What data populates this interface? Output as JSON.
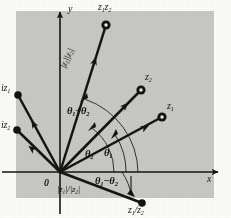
{
  "figure": {
    "background_color": "#c9c9c6",
    "page_color": "#fdfdfb",
    "ink_color": "#141414",
    "panel": {
      "x": 16,
      "y": 11,
      "width": 198,
      "height": 187
    }
  },
  "axes": {
    "x_label": "x",
    "y_label": "y",
    "origin_label": "0",
    "origin": {
      "x": 60,
      "y": 172
    },
    "x_axis": {
      "x1": 2,
      "y1": 172,
      "x2": 224,
      "y2": 172
    },
    "y_axis": {
      "x1": 60,
      "y1": 214,
      "x2": 60,
      "y2": 7
    }
  },
  "vectors": [
    {
      "name": "z1z2",
      "label": "z₁z₂",
      "label_html": "z<sub>1</sub>z<sub>2</sub>",
      "tip": {
        "x": 106,
        "y": 25
      },
      "label_pos": {
        "x": 98,
        "y": 2
      },
      "marker": "dot-open"
    },
    {
      "name": "z2",
      "label": "z₂",
      "label_html": "z<sub>2</sub>",
      "tip": {
        "x": 141,
        "y": 90
      },
      "label_pos": {
        "x": 145,
        "y": 72
      },
      "marker": "dot-open"
    },
    {
      "name": "z1",
      "label": "z₁",
      "label_html": "z<sub>1</sub>",
      "tip": {
        "x": 162,
        "y": 117
      },
      "label_pos": {
        "x": 167,
        "y": 101
      },
      "marker": "dot-open"
    },
    {
      "name": "iz1",
      "label": "iz₁",
      "label_html": "iz<sub>1</sub>",
      "tip": {
        "x": 18,
        "y": 95
      },
      "label_pos": {
        "x": 1,
        "y": 83
      },
      "marker": "dot-filled"
    },
    {
      "name": "iz2",
      "label": "iz₂",
      "label_html": "iz<sub>2</sub>",
      "tip": {
        "x": 17,
        "y": 130
      },
      "label_pos": {
        "x": 1,
        "y": 120
      },
      "marker": "dot-filled"
    },
    {
      "name": "z1-over-z2",
      "label": "z₁/z₂",
      "label_html": "z<sub>1</sub>/z<sub>2</sub>",
      "tip": {
        "x": 142,
        "y": 203
      },
      "label_pos": {
        "x": 130,
        "y": 205
      },
      "marker": "dot-filled"
    }
  ],
  "angles": [
    {
      "name": "theta1",
      "label": "θ₁",
      "label_html": "θ<sub>1</sub>",
      "label_pos": {
        "x": 104,
        "y": 150
      },
      "radius": 66
    },
    {
      "name": "theta2",
      "label": "θ₂",
      "label_html": "θ<sub>2</sub>",
      "label_pos": {
        "x": 86,
        "y": 151
      },
      "radius": 54
    },
    {
      "name": "theta1-plus-theta2",
      "label": "θ₁+θ₂",
      "label_html": "θ<sub>1</sub>+θ<sub>2</sub>",
      "label_pos": {
        "x": 67,
        "y": 105
      },
      "radius": 78
    },
    {
      "name": "theta1-minus-theta2",
      "label": "θ₁−θ₂",
      "label_html": "θ<sub>1</sub>−θ<sub>2</sub>",
      "label_pos": {
        "x": 96,
        "y": 176
      },
      "radius": 62
    }
  ],
  "magnitudes": [
    {
      "name": "product-magnitude",
      "label": "|z₁||z₂|",
      "label_html": "|z<sub>1</sub>||z<sub>2</sub>|",
      "label_pos": {
        "x": 66,
        "y": 105
      },
      "rotated": true
    },
    {
      "name": "quotient-magnitude",
      "label": "|z₁|/|z₂|",
      "label_html": "|z<sub>1</sub>|/|z<sub>2</sub>|",
      "label_pos": {
        "x": 70,
        "y": 184
      },
      "rotated": false
    }
  ]
}
